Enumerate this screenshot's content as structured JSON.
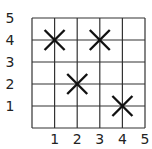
{
  "chart_data": {
    "type": "scatter",
    "title": "",
    "xlabel": "",
    "ylabel": "",
    "xlim": [
      0,
      5
    ],
    "ylim": [
      0,
      5
    ],
    "grid": true,
    "marker": "x",
    "x_ticks": [
      "1",
      "2",
      "3",
      "4",
      "5"
    ],
    "y_ticks": [
      "1",
      "2",
      "3",
      "4",
      "5"
    ],
    "points": [
      {
        "x": 1,
        "y": 4
      },
      {
        "x": 3,
        "y": 4
      },
      {
        "x": 2,
        "y": 2
      },
      {
        "x": 4,
        "y": 1
      }
    ]
  },
  "colors": {
    "grid": "#333333",
    "marker": "#111111",
    "text": "#222222"
  }
}
